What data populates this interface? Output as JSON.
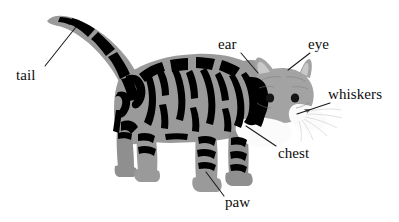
{
  "figure": {
    "background_color": "#ffffff",
    "fur_base_color": "#999999",
    "fur_shadow_color": "#8a8a8a",
    "stripe_color": "#000000",
    "muzzle_color": "#fafafa",
    "eye_color": "#141414",
    "label_color": "#0d0d0d",
    "leader_line_color": "#1a1a1a"
  },
  "labels": [
    {
      "id": "tail",
      "text": "tail",
      "x": 16,
      "y": 68,
      "leader": {
        "x1": 45,
        "y1": 66,
        "x2": 76,
        "y2": 27
      }
    },
    {
      "id": "ear",
      "text": "ear",
      "x": 218,
      "y": 37,
      "leader": {
        "x1": 241,
        "y1": 53,
        "x2": 258,
        "y2": 73
      }
    },
    {
      "id": "eye",
      "text": "eye",
      "x": 308,
      "y": 37,
      "leader": {
        "x1": 310,
        "y1": 53,
        "x2": 288,
        "y2": 70
      }
    },
    {
      "id": "whiskers",
      "text": "whiskers",
      "x": 328,
      "y": 87,
      "leader": {
        "x1": 330,
        "y1": 103,
        "x2": 297,
        "y2": 114
      }
    },
    {
      "id": "chest",
      "text": "chest",
      "x": 278,
      "y": 146,
      "leader": {
        "x1": 276,
        "y1": 146,
        "x2": 246,
        "y2": 126
      }
    },
    {
      "id": "paw",
      "text": "paw",
      "x": 225,
      "y": 195,
      "leader": {
        "x1": 224,
        "y1": 196,
        "x2": 206,
        "y2": 172
      }
    }
  ],
  "anatomy_parts": [
    "tail",
    "ear",
    "eye",
    "whiskers",
    "chest",
    "paw"
  ]
}
